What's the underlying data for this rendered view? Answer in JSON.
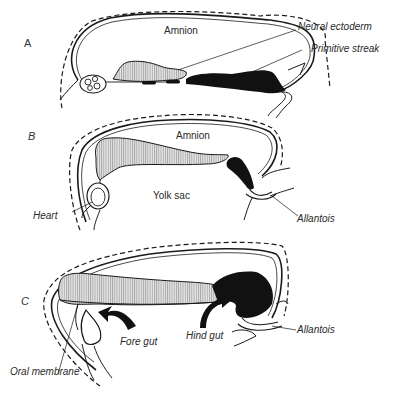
{
  "figure": {
    "colors": {
      "ink": "#1a1a1a",
      "hatch_fill": "#cfcfcf",
      "background": "#ffffff"
    },
    "panels": [
      {
        "id": "A",
        "letter": "A",
        "labels": {
          "amnion": "Amnion",
          "neural_ectoderm": "Neural ectoderm",
          "primitive_streak": "Primitive streak"
        }
      },
      {
        "id": "B",
        "letter": "B",
        "labels": {
          "amnion": "Amnion",
          "yolk_sac": "Yolk sac",
          "heart": "Heart",
          "allantois": "Allantois"
        }
      },
      {
        "id": "C",
        "letter": "C",
        "labels": {
          "fore_gut": "Fore gut",
          "hind_gut": "Hind gut",
          "allantois": "Allantois",
          "oral_membrane": "Oral membrane"
        }
      }
    ]
  }
}
